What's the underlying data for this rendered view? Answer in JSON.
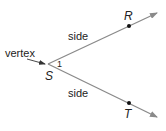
{
  "diagram": {
    "labels": {
      "vertex": "vertex",
      "side_upper": "side",
      "side_lower": "side",
      "angle_number": "1"
    },
    "points": {
      "S": "S",
      "R": "R",
      "T": "T"
    },
    "colors": {
      "ray": "#8a8a8a",
      "text": "#222222",
      "point": "#111111"
    }
  }
}
